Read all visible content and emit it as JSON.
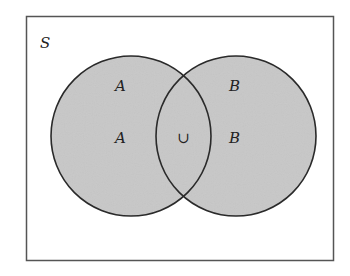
{
  "diagram": {
    "type": "venn",
    "universe_label": "S",
    "sets": [
      {
        "name": "A",
        "labels": [
          "A",
          "A"
        ]
      },
      {
        "name": "B",
        "labels": [
          "B",
          "B"
        ]
      }
    ],
    "operator_symbol": "∪",
    "operation": "union",
    "colors": {
      "fill": "#c8c8c8",
      "stroke": "#2a2a2a",
      "frame": "#555555",
      "background": "#ffffff"
    }
  }
}
